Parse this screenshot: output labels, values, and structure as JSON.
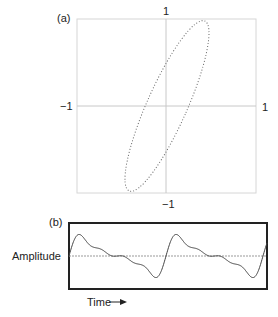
{
  "panel_a": {
    "label": "(a)",
    "tick_top": "1",
    "tick_left": "−1",
    "tick_right": "1",
    "tick_bottom": "−1",
    "box": {
      "x1": 77,
      "y1": 19,
      "x2": 256,
      "y2": 193
    },
    "axis_center": {
      "x": 166,
      "y": 106
    },
    "ellipse": {
      "cx": 167,
      "cy": 106,
      "rx": 20,
      "ry": 93,
      "rotate_deg": 24
    },
    "axis_color": "#cfcfcf",
    "curve_color": "#555555"
  },
  "panel_b": {
    "label": "(b)",
    "y_label": "Amplitude",
    "x_label": "Time",
    "x_arrow": "arrow-right",
    "box": {
      "x1": 69,
      "y1": 223,
      "x2": 267,
      "y2": 289
    },
    "baseline_y": 256,
    "period_px": 97,
    "harmonics": [
      {
        "n": 1,
        "amp": 0.55,
        "phase": 0.0
      },
      {
        "n": 2,
        "amp": 0.35,
        "phase": 0.0
      },
      {
        "n": 3,
        "amp": 0.18,
        "phase": 0.0
      },
      {
        "n": 4,
        "amp": 0.12,
        "phase": 0.0
      }
    ],
    "amp_scale": 24
  }
}
